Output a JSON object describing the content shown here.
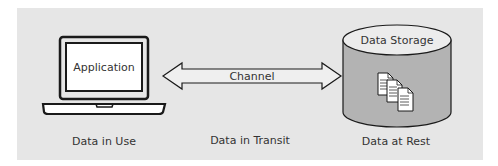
{
  "diagram": {
    "nodes": {
      "application": {
        "label": "Application",
        "caption": "Data in Use"
      },
      "channel": {
        "label": "Channel",
        "caption": "Data in Transit"
      },
      "storage": {
        "label": "Data Storage",
        "caption": "Data at Rest"
      }
    },
    "icons": {
      "laptop": "laptop-icon",
      "arrow": "double-arrow-icon",
      "cylinder": "database-cylinder-icon",
      "documents": "documents-stack-icon"
    },
    "colors": {
      "panel": "#e6e6e6",
      "cylinder_body": "#b3b3b3",
      "cylinder_top": "#ececec",
      "arrow_fill": "#efefef",
      "stroke": "#222222"
    }
  }
}
